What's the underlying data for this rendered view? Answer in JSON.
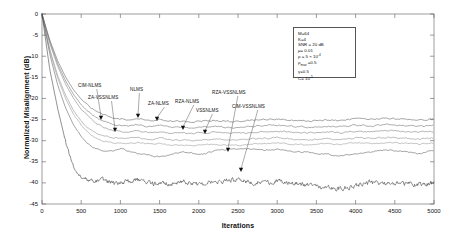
{
  "chart_data": {
    "type": "line",
    "title": "",
    "xlabel": "Iterations",
    "ylabel": "Normalized Misalignment (dB)",
    "xlim": [
      0,
      5000
    ],
    "ylim": [
      -45,
      0
    ],
    "xticks": [
      0,
      500,
      1000,
      1500,
      2000,
      2500,
      3000,
      3500,
      4000,
      4500,
      5000
    ],
    "yticks": [
      0,
      -5,
      -10,
      -15,
      -20,
      -25,
      -30,
      -35,
      -40,
      -45
    ],
    "grid": false,
    "legend_position": "annotated-arrows",
    "series": [
      {
        "name": "NLMS",
        "color": "#4a4a4a",
        "steady_state_db": -24.8,
        "convergence_iteration": 900,
        "x": [
          0,
          100,
          200,
          300,
          400,
          500,
          600,
          700,
          800,
          900,
          1000,
          1100,
          1200,
          1300,
          1400,
          1500,
          1600,
          1700,
          1800,
          1900,
          2000,
          2200,
          2400,
          2600,
          2800,
          3000,
          3200,
          3400,
          3600,
          3800,
          4000,
          4200,
          4400,
          4600,
          4800,
          5000
        ],
        "y": [
          0,
          -6.2,
          -11.1,
          -14.9,
          -17.9,
          -20.2,
          -21.9,
          -23.1,
          -24.0,
          -24.6,
          -24.9,
          -25.1,
          -24.7,
          -25.0,
          -25.3,
          -24.9,
          -25.2,
          -25.5,
          -25.3,
          -25.6,
          -25.4,
          -25.2,
          -25.5,
          -25.3,
          -25.1,
          -24.9,
          -25.2,
          -25.4,
          -25.1,
          -25.3,
          -24.8,
          -25.0,
          -24.7,
          -24.9,
          -25.1,
          -24.9
        ]
      },
      {
        "name": "ZA-NLMS",
        "color": "#5a5a5a",
        "steady_state_db": -26.4,
        "convergence_iteration": 950,
        "x": [
          0,
          100,
          200,
          300,
          400,
          500,
          600,
          700,
          800,
          900,
          1000,
          1100,
          1200,
          1300,
          1400,
          1500,
          1600,
          1700,
          1800,
          1900,
          2000,
          2200,
          2400,
          2600,
          2800,
          3000,
          3200,
          3400,
          3600,
          3800,
          4000,
          4200,
          4400,
          4600,
          4800,
          5000
        ],
        "y": [
          0,
          -6.6,
          -11.8,
          -15.8,
          -19.0,
          -21.5,
          -23.3,
          -24.6,
          -25.5,
          -26.1,
          -26.4,
          -26.5,
          -26.2,
          -26.5,
          -26.7,
          -26.4,
          -26.7,
          -26.9,
          -26.8,
          -27.0,
          -26.8,
          -26.6,
          -26.9,
          -26.7,
          -26.5,
          -26.3,
          -26.6,
          -26.8,
          -26.5,
          -26.7,
          -26.3,
          -26.5,
          -26.2,
          -26.4,
          -26.6,
          -26.4
        ]
      },
      {
        "name": "RZA-NLMS",
        "color": "#6a6a6a",
        "steady_state_db": -27.8,
        "convergence_iteration": 950,
        "x": [
          0,
          100,
          200,
          300,
          400,
          500,
          600,
          700,
          800,
          900,
          1000,
          1100,
          1200,
          1300,
          1400,
          1500,
          1600,
          1700,
          1800,
          1900,
          2000,
          2200,
          2400,
          2600,
          2800,
          3000,
          3200,
          3400,
          3600,
          3800,
          4000,
          4200,
          4400,
          4600,
          4800,
          5000
        ],
        "y": [
          0,
          -7.0,
          -12.4,
          -16.6,
          -19.9,
          -22.6,
          -24.5,
          -25.9,
          -26.9,
          -27.5,
          -27.8,
          -27.9,
          -27.6,
          -27.9,
          -28.1,
          -27.8,
          -28.1,
          -28.3,
          -28.2,
          -28.4,
          -28.2,
          -28.0,
          -28.3,
          -28.1,
          -27.9,
          -27.7,
          -28.0,
          -28.2,
          -27.9,
          -28.1,
          -27.7,
          -27.9,
          -27.6,
          -27.8,
          -28.0,
          -27.8
        ]
      },
      {
        "name": "ZA-VSSNLMS",
        "color": "#7a7a7a",
        "steady_state_db": -29.2,
        "convergence_iteration": 800,
        "x": [
          0,
          100,
          200,
          300,
          400,
          500,
          600,
          700,
          800,
          900,
          1000,
          1100,
          1200,
          1300,
          1400,
          1500,
          1600,
          1700,
          1800,
          1900,
          2000,
          2200,
          2400,
          2600,
          2800,
          3000,
          3200,
          3400,
          3600,
          3800,
          4000,
          4200,
          4400,
          4600,
          4800,
          5000
        ],
        "y": [
          0,
          -8.4,
          -14.6,
          -19.2,
          -22.8,
          -25.4,
          -27.2,
          -28.4,
          -29.0,
          -29.3,
          -29.4,
          -29.5,
          -29.2,
          -29.5,
          -29.7,
          -29.4,
          -29.7,
          -29.9,
          -29.8,
          -30.0,
          -29.8,
          -29.6,
          -29.9,
          -29.7,
          -29.5,
          -29.3,
          -29.6,
          -29.8,
          -29.5,
          -29.7,
          -29.3,
          -29.5,
          -29.2,
          -29.4,
          -29.6,
          -29.4
        ]
      },
      {
        "name": "VSSNLMS",
        "color": "#8a8a8a",
        "steady_state_db": -30.4,
        "convergence_iteration": 800,
        "x": [
          0,
          100,
          200,
          300,
          400,
          500,
          600,
          700,
          800,
          900,
          1000,
          1100,
          1200,
          1300,
          1400,
          1500,
          1600,
          1700,
          1800,
          1900,
          2000,
          2200,
          2400,
          2600,
          2800,
          3000,
          3200,
          3400,
          3600,
          3800,
          4000,
          4200,
          4400,
          4600,
          4800,
          5000
        ],
        "y": [
          0,
          -8.8,
          -15.2,
          -20.0,
          -23.7,
          -26.4,
          -28.3,
          -29.5,
          -30.1,
          -30.5,
          -30.6,
          -30.7,
          -30.4,
          -30.7,
          -30.9,
          -30.6,
          -30.9,
          -31.1,
          -31.0,
          -31.2,
          -31.0,
          -30.8,
          -31.1,
          -30.9,
          -30.7,
          -30.5,
          -30.8,
          -31.0,
          -30.7,
          -30.9,
          -30.5,
          -30.7,
          -30.4,
          -30.6,
          -30.8,
          -30.6
        ]
      },
      {
        "name": "RZA-VSSNLMS",
        "color": "#4a4a4a",
        "steady_state_db": -32.6,
        "convergence_iteration": 800,
        "x": [
          0,
          100,
          200,
          300,
          400,
          500,
          600,
          700,
          800,
          900,
          1000,
          1100,
          1200,
          1300,
          1400,
          1500,
          1600,
          1700,
          1800,
          1900,
          2000,
          2100,
          2200,
          2400,
          2600,
          2800,
          3000,
          3200,
          3400,
          3600,
          3800,
          4000,
          4200,
          4400,
          4600,
          4800,
          5000
        ],
        "y": [
          0,
          -9.6,
          -16.8,
          -22.2,
          -26.2,
          -29.0,
          -30.9,
          -32.0,
          -32.6,
          -32.4,
          -31.9,
          -32.4,
          -33.0,
          -33.3,
          -33.6,
          -33.9,
          -33.6,
          -33.1,
          -32.7,
          -32.9,
          -33.3,
          -33.0,
          -32.4,
          -32.1,
          -31.8,
          -32.3,
          -32.0,
          -32.5,
          -32.8,
          -33.2,
          -33.6,
          -33.1,
          -32.6,
          -32.2,
          -32.6,
          -33.1,
          -32.3
        ]
      },
      {
        "name": "CIM-VSSNLMS",
        "color": "#333333",
        "steady_state_db": -40.1,
        "convergence_iteration": 520,
        "x": [
          0,
          100,
          200,
          300,
          400,
          500,
          600,
          700,
          800,
          900,
          1000,
          1100,
          1200,
          1300,
          1400,
          1500,
          1600,
          1700,
          1800,
          1900,
          2000,
          2100,
          2200,
          2300,
          2400,
          2500,
          2600,
          2700,
          2800,
          2900,
          3000,
          3200,
          3400,
          3600,
          3800,
          4000,
          4200,
          4400,
          4600,
          4800,
          5000
        ],
        "y": [
          0,
          -13.2,
          -22.4,
          -30.2,
          -35.8,
          -38.6,
          -39.2,
          -39.6,
          -39.3,
          -40.2,
          -40.0,
          -39.6,
          -39.1,
          -39.8,
          -40.2,
          -40.0,
          -40.3,
          -40.1,
          -39.6,
          -40.2,
          -40.4,
          -40.0,
          -39.5,
          -39.8,
          -39.3,
          -39.0,
          -39.6,
          -40.1,
          -39.7,
          -40.0,
          -39.5,
          -40.0,
          -40.6,
          -41.1,
          -41.5,
          -40.6,
          -39.9,
          -40.2,
          -40.0,
          -40.4,
          -40.0
        ]
      }
    ],
    "annotations": [
      {
        "label": "CIM-NLMS",
        "label_x": 78,
        "label_y": 83,
        "tip_x": 101,
        "tip_y": 120
      },
      {
        "label": "ZA-VSSNLMS",
        "label_x": 88,
        "label_y": 95,
        "tip_x": 115,
        "tip_y": 132
      },
      {
        "label": "NLMS",
        "label_x": 130,
        "label_y": 87,
        "tip_x": 138,
        "tip_y": 118
      },
      {
        "label": "ZA-NLMS",
        "label_x": 148,
        "label_y": 101,
        "tip_x": 157,
        "tip_y": 121
      },
      {
        "label": "RZA-NLMS",
        "label_x": 175,
        "label_y": 99,
        "tip_x": 183,
        "tip_y": 130
      },
      {
        "label": "VSSNLMS",
        "label_x": 196,
        "label_y": 108,
        "tip_x": 205,
        "tip_y": 134
      },
      {
        "label": "RZA-VSSNLMS",
        "label_x": 212,
        "label_y": 90,
        "tip_x": 228,
        "tip_y": 152
      },
      {
        "label": "CIM-VSSNLMS",
        "label_x": 232,
        "label_y": 104,
        "tip_x": 241,
        "tip_y": 172
      }
    ],
    "parameters_box": {
      "lines": [
        {
          "text": "M=64"
        },
        {
          "text": "K=4"
        },
        {
          "text": "SNR = 20 dB"
        },
        {
          "text": "μ= 0.01"
        },
        {
          "text": "ρ = 5 × 10",
          "sup": "-4"
        },
        {
          "text": "ρ",
          "sub": "max",
          "text2": " =0.5"
        },
        {
          "text": "γ=0.5"
        },
        {
          "text": "C= 10",
          "sup": "-5"
        }
      ]
    }
  }
}
